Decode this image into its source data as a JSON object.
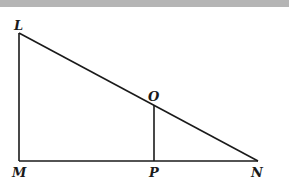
{
  "diagram": {
    "type": "geometry-figure",
    "points": {
      "L": "L",
      "M": "M",
      "N": "N",
      "O": "O",
      "P": "P"
    },
    "segments": [
      "LM",
      "MN",
      "LN",
      "OP"
    ],
    "colors": {
      "stroke": "#1a1a1a",
      "top_band": "#b5b5b5",
      "background": "#ffffff"
    }
  }
}
